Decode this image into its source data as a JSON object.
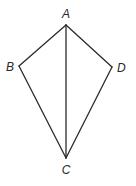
{
  "diagram": {
    "type": "geometry-kite",
    "vertices": [
      {
        "id": "A",
        "label": "A",
        "x": 66,
        "y": 25,
        "label_x": 66,
        "label_y": 18,
        "anchor": "middle"
      },
      {
        "id": "B",
        "label": "B",
        "x": 19,
        "y": 66,
        "label_x": 14,
        "label_y": 71,
        "anchor": "end"
      },
      {
        "id": "C",
        "label": "C",
        "x": 66,
        "y": 158,
        "label_x": 66,
        "label_y": 174,
        "anchor": "middle"
      },
      {
        "id": "D",
        "label": "D",
        "x": 112,
        "y": 67,
        "label_x": 117,
        "label_y": 72,
        "anchor": "start"
      }
    ],
    "edges": [
      {
        "from": "A",
        "to": "B"
      },
      {
        "from": "B",
        "to": "C"
      },
      {
        "from": "C",
        "to": "D"
      },
      {
        "from": "D",
        "to": "A"
      },
      {
        "from": "A",
        "to": "C"
      }
    ],
    "colors": {
      "line": "#2a2a2a",
      "background": "#ffffff"
    }
  }
}
